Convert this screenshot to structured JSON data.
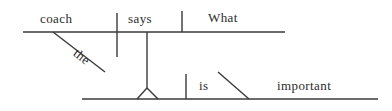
{
  "diagram": {
    "type": "reed-kellogg-sentence-diagram",
    "sentence": "The coach says what is important.",
    "ink_color": "#3a3a3a",
    "background_color": "#ffffff",
    "words": [
      {
        "id": "subject",
        "text": "coach",
        "role": "subject",
        "x": 40,
        "y": 11,
        "rotation": 0
      },
      {
        "id": "article",
        "text": "the",
        "role": "article-modifier",
        "x": 70,
        "y": 42,
        "rotation": 38
      },
      {
        "id": "main-verb",
        "text": "says",
        "role": "main-verb",
        "x": 128,
        "y": 11,
        "rotation": 0
      },
      {
        "id": "clause-subject",
        "text": "What",
        "role": "noun-clause-subject",
        "x": 208,
        "y": 10,
        "rotation": 0
      },
      {
        "id": "linking-verb",
        "text": "is",
        "role": "linking-verb",
        "x": 199,
        "y": 78,
        "rotation": 0
      },
      {
        "id": "predicate-adjective",
        "text": "important",
        "role": "predicate-adjective",
        "x": 277,
        "y": 78,
        "rotation": 0
      }
    ],
    "lines": [
      {
        "id": "main-baseline",
        "kind": "baseline",
        "x1": 23,
        "y1": 32,
        "x2": 285,
        "y2": 32
      },
      {
        "id": "subject-verb-divider",
        "kind": "vertical-divider",
        "x1": 117,
        "y1": 13,
        "x2": 117,
        "y2": 57
      },
      {
        "id": "verb-object-divider",
        "kind": "vertical-divider",
        "x1": 182,
        "y1": 11,
        "x2": 182,
        "y2": 32
      },
      {
        "id": "article-slant",
        "kind": "modifier-slant",
        "x1": 53,
        "y1": 32,
        "x2": 105,
        "y2": 72
      },
      {
        "id": "clause-stem",
        "kind": "clause-connector",
        "x1": 147,
        "y1": 32,
        "x2": 147,
        "y2": 88
      },
      {
        "id": "tripod-left-leg",
        "kind": "tripod-leg",
        "x1": 147,
        "y1": 88,
        "x2": 137,
        "y2": 99
      },
      {
        "id": "tripod-right-leg",
        "kind": "tripod-leg",
        "x1": 147,
        "y1": 88,
        "x2": 158,
        "y2": 99
      },
      {
        "id": "clause-baseline",
        "kind": "baseline",
        "x1": 82,
        "y1": 99,
        "x2": 378,
        "y2": 99
      },
      {
        "id": "clause-subject-verb-divider",
        "kind": "vertical-divider",
        "x1": 186,
        "y1": 74,
        "x2": 186,
        "y2": 99
      },
      {
        "id": "predicate-adjective-slant",
        "kind": "predicate-slant",
        "x1": 218,
        "y1": 72,
        "x2": 249,
        "y2": 99
      }
    ]
  }
}
